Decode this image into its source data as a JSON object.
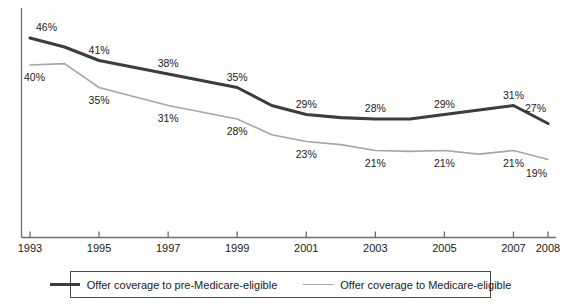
{
  "chart_data": {
    "type": "line",
    "title": "",
    "subtitle": "",
    "xlabel": "",
    "ylabel": "",
    "grid": false,
    "legend_position": "bottom",
    "x": [
      1993,
      1994,
      1995,
      1996,
      1997,
      1998,
      1999,
      2000,
      2001,
      2002,
      2003,
      2004,
      2005,
      2006,
      2007,
      2008
    ],
    "xlim": [
      1993,
      2008
    ],
    "ylim": [
      0,
      50
    ],
    "xtick_labels": [
      "1993",
      "1995",
      "1997",
      "1999",
      "2001",
      "2003",
      "2005",
      "2007",
      "2008"
    ],
    "xtick_values": [
      1993,
      1995,
      1997,
      1999,
      2001,
      2003,
      2005,
      2007,
      2008
    ],
    "series": [
      {
        "name": "Offer coverage to pre-Medicare-eligible",
        "color": "#3d3d3d",
        "labeled_points": [
          {
            "x": 1993,
            "y": 46,
            "label": "46%"
          },
          {
            "x": 1995,
            "y": 41,
            "label": "41%"
          },
          {
            "x": 1997,
            "y": 38,
            "label": "38%"
          },
          {
            "x": 1999,
            "y": 35,
            "label": "35%"
          },
          {
            "x": 2001,
            "y": 29,
            "label": "29%"
          },
          {
            "x": 2003,
            "y": 28,
            "label": "28%"
          },
          {
            "x": 2005,
            "y": 29,
            "label": "29%"
          },
          {
            "x": 2007,
            "y": 31,
            "label": "31%"
          },
          {
            "x": 2008,
            "y": 27,
            "label": "27%"
          }
        ],
        "values": [
          46,
          44,
          41,
          39.5,
          38,
          36.5,
          35,
          31,
          29,
          28.3,
          28,
          28,
          29,
          30,
          31,
          27
        ]
      },
      {
        "name": "Offer coverage to Medicare-eligible",
        "color": "#a6a6a6",
        "labeled_points": [
          {
            "x": 1993,
            "y": 40,
            "label": "40%"
          },
          {
            "x": 1995,
            "y": 35,
            "label": "35%"
          },
          {
            "x": 1997,
            "y": 31,
            "label": "31%"
          },
          {
            "x": 1999,
            "y": 28,
            "label": "28%"
          },
          {
            "x": 2001,
            "y": 23,
            "label": "23%"
          },
          {
            "x": 2003,
            "y": 21,
            "label": "21%"
          },
          {
            "x": 2005,
            "y": 21,
            "label": "21%"
          },
          {
            "x": 2007,
            "y": 21,
            "label": "21%"
          },
          {
            "x": 2008,
            "y": 19,
            "label": "19%"
          }
        ],
        "values": [
          40,
          40.3,
          35,
          33,
          31,
          29.5,
          28,
          24.5,
          23,
          22.3,
          21,
          20.8,
          21,
          20.2,
          21,
          19
        ]
      }
    ]
  },
  "legend": {
    "entries": [
      {
        "label": "Offer coverage to pre-Medicare-eligible"
      },
      {
        "label": "Offer coverage to Medicare-eligible"
      }
    ]
  }
}
